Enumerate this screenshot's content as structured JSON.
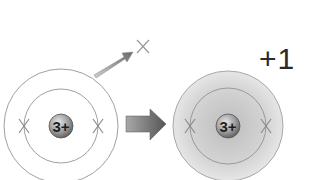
{
  "diagram": {
    "left_atom": {
      "nucleus_label": "3+",
      "shells": 2,
      "electrons": [
        "inner-left",
        "inner-right"
      ]
    },
    "ejected_electron": {
      "symbol": "×"
    },
    "transition_arrow": "right-arrow",
    "right_ion": {
      "nucleus_label": "3+",
      "shells": 2,
      "electrons": [
        "inner-left",
        "inner-right"
      ],
      "charge_label": "+1"
    },
    "colors": {
      "line": "#9a9a9a",
      "nucleus": "#8a8a8a",
      "ion_shading": "#d6d6d6",
      "arrow": "#6e6e6e",
      "text": "#2a2a2a"
    }
  }
}
